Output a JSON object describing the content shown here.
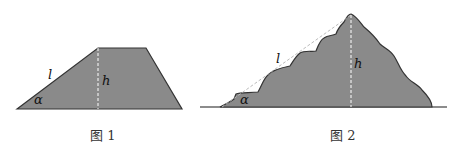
{
  "figure1": {
    "caption": "图 1",
    "labels": {
      "slope": "l",
      "height": "h",
      "angle": "α"
    },
    "fill_color": "#8a8a8a"
  },
  "figure2": {
    "caption": "图 2",
    "labels": {
      "slope": "l",
      "height": "h",
      "angle": "α"
    },
    "fill_color": "#8a8a8a"
  }
}
